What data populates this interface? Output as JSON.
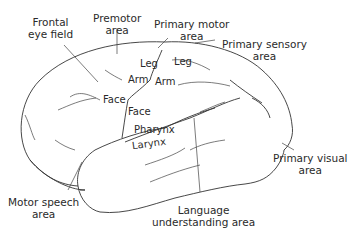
{
  "diagram": {
    "type": "brain-lateral-view",
    "labels": {
      "frontal_eye_field": "Frontal\neye field",
      "premotor_area": "Premotor\narea",
      "primary_motor_area": "Primary motor\narea",
      "primary_sensory_area": "Primary sensory\narea",
      "primary_visual_area": "Primary visual\narea",
      "motor_speech_area": "Motor speech\narea",
      "language_understanding_area": "Language\nunderstanding area",
      "motor_leg": "Leg",
      "motor_arm": "Arm",
      "motor_face": "Face",
      "sensory_leg": "Leg",
      "sensory_arm": "Arm",
      "sensory_face": "Face",
      "pharynx": "Pharynx",
      "larynx": "Larynx"
    },
    "colors": {
      "line": "#333333",
      "text": "#2a2a2a",
      "background": "#ffffff"
    }
  }
}
